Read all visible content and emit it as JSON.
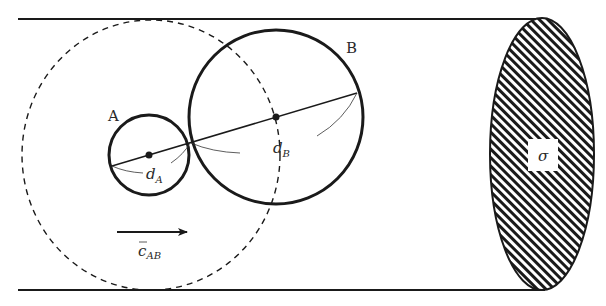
{
  "diagram": {
    "type": "collision-cylinder",
    "colors": {
      "ink": "#1a1a1a",
      "hatch": "#1a1a1a",
      "background": "#ffffff"
    },
    "cylinder": {
      "top_y": 19,
      "bottom_y": 290,
      "left_x": 18
    },
    "cross_section": {
      "label": "σ",
      "cx": 542,
      "cy": 154,
      "rx": 52,
      "ry": 136
    },
    "sphere_A": {
      "label": "A",
      "cx": 149,
      "cy": 155,
      "r": 40,
      "diameter_label": "d",
      "diameter_sub": "A"
    },
    "sphere_B": {
      "label": "B",
      "cx": 276,
      "cy": 117,
      "r": 87,
      "diameter_label": "d",
      "diameter_sub": "B"
    },
    "collision_sphere": {
      "style": "dashed",
      "cx": 151,
      "cy": 155,
      "rx": 129,
      "ry": 135
    },
    "velocity": {
      "label": "c",
      "label_sub": "AB",
      "bar": "‾",
      "x1": 117,
      "x2": 187,
      "y": 232
    }
  }
}
